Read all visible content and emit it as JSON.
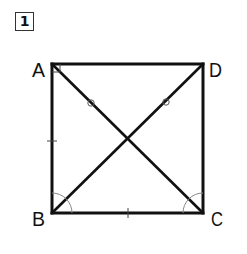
{
  "problem": {
    "number": "1"
  },
  "figure": {
    "type": "square with diagonals",
    "vertices": [
      {
        "label": "A",
        "x": 52,
        "y": 64
      },
      {
        "label": "D",
        "x": 203,
        "y": 64
      },
      {
        "label": "B",
        "x": 52,
        "y": 213
      },
      {
        "label": "C",
        "x": 203,
        "y": 213
      }
    ],
    "labels": {
      "A": "A",
      "B": "B",
      "C": "C",
      "D": "D"
    },
    "marks": {
      "right_angle_at": "A",
      "equal_sides_tick": [
        "AB",
        "BC"
      ],
      "equal_segment_circles": [
        "on AC",
        "on BD"
      ],
      "angle_arcs_at": [
        "B",
        "C"
      ]
    },
    "colors": {
      "stroke": "#111111",
      "arc": "#888888"
    }
  }
}
